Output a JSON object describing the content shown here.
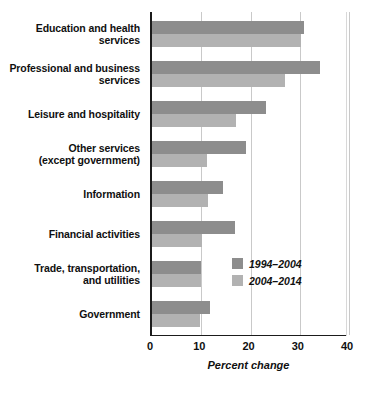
{
  "chart_data": {
    "type": "bar",
    "orientation": "horizontal",
    "title": "",
    "xlabel": "Percent change",
    "ylabel": "",
    "xlim": [
      0,
      40
    ],
    "xticks": [
      0,
      10,
      20,
      30,
      40
    ],
    "xtick_labels": [
      "0",
      "10",
      "20",
      "30",
      "40"
    ],
    "grid": "vertical",
    "legend_position": "inside-lower-right",
    "categories": [
      "Education and health services",
      "Professional and business services",
      "Leisure and hospitality",
      "Other services (except government)",
      "Information",
      "Financial activities",
      "Trade, transportation, and utilities",
      "Government"
    ],
    "category_lines": [
      [
        "Education and health",
        "services"
      ],
      [
        "Professional and business",
        "services"
      ],
      [
        "Leisure and hospitality"
      ],
      [
        "Other services",
        "(except government)"
      ],
      [
        "Information"
      ],
      [
        "Financial activities"
      ],
      [
        "Trade, transportation,",
        "and utilities"
      ],
      [
        "Government"
      ]
    ],
    "series": [
      {
        "name": "1994–2004",
        "color": "#8d8d8d",
        "values": [
          30.9,
          34.1,
          23.2,
          19.1,
          14.4,
          16.9,
          10.0,
          11.8
        ]
      },
      {
        "name": "2004–2014",
        "color": "#b2b2b2",
        "values": [
          30.3,
          27.0,
          17.1,
          11.2,
          11.4,
          10.2,
          10.0,
          9.7
        ]
      }
    ]
  },
  "legend": {
    "items": [
      {
        "label": "1994–2004",
        "color": "#8d8d8d"
      },
      {
        "label": "2004–2014",
        "color": "#b2b2b2"
      }
    ]
  },
  "axis": {
    "x_title": "Percent change",
    "ticks": [
      "0",
      "10",
      "20",
      "30",
      "40"
    ]
  },
  "colors": {
    "series_1994_2004": "#8d8d8d",
    "series_2004_2014": "#b2b2b2",
    "axis_line": "#1b1b1b",
    "gridline": "#c9c9c9",
    "background": "#ffffff",
    "text": "#101010"
  }
}
